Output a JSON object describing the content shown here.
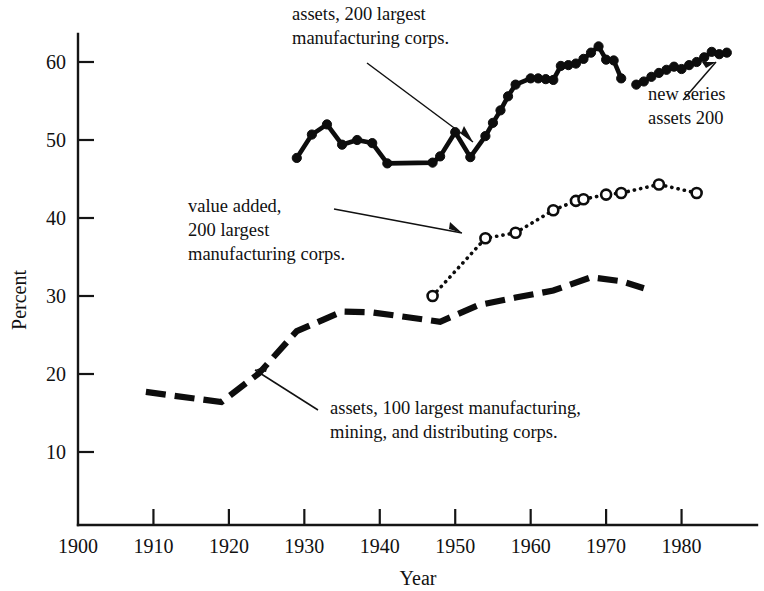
{
  "chart_data": {
    "type": "line",
    "title": "",
    "xlabel": "Year",
    "ylabel": "Percent",
    "xlim": [
      1900,
      1990
    ],
    "ylim": [
      0,
      65
    ],
    "xticks": [
      1900,
      1910,
      1920,
      1930,
      1940,
      1950,
      1960,
      1970,
      1980
    ],
    "yticks": [
      10,
      20,
      30,
      40,
      50,
      60
    ],
    "grid": false,
    "legend": "annotations on plot",
    "series": [
      {
        "name": "assets, 200 largest manufacturing corps.",
        "style": "solid line with filled circle markers",
        "x": [
          1929,
          1931,
          1933,
          1935,
          1937,
          1939,
          1941,
          1947,
          1948,
          1950,
          1952,
          1954,
          1955,
          1956,
          1957,
          1958,
          1960,
          1961,
          1962,
          1963,
          1964,
          1965,
          1966,
          1967,
          1968,
          1969,
          1970,
          1971,
          1972
        ],
        "values": [
          47.7,
          50.7,
          52.0,
          49.4,
          50.0,
          49.6,
          47.0,
          47.1,
          47.9,
          51.0,
          47.8,
          50.5,
          52.2,
          53.8,
          55.6,
          57.1,
          57.9,
          57.9,
          57.8,
          57.7,
          59.5,
          59.6,
          59.8,
          60.4,
          61.2,
          62.0,
          60.3,
          60.2,
          57.9
        ]
      },
      {
        "name": "new series assets 200",
        "style": "solid line with filled circle markers",
        "x": [
          1974,
          1975,
          1976,
          1977,
          1978,
          1979,
          1980,
          1981,
          1982,
          1983,
          1984,
          1985,
          1986
        ],
        "values": [
          57.1,
          57.5,
          58.1,
          58.6,
          59.0,
          59.4,
          59.1,
          59.6,
          60.0,
          60.6,
          61.3,
          61.0,
          61.2
        ]
      },
      {
        "name": "value added, 200 largest manufacturing corps.",
        "style": "dotted line with open circle markers",
        "x": [
          1947,
          1954,
          1958,
          1963,
          1966,
          1967,
          1970,
          1972,
          1977,
          1982
        ],
        "values": [
          30.0,
          37.4,
          38.1,
          41.0,
          42.2,
          42.4,
          43.0,
          43.2,
          44.3,
          43.2
        ]
      },
      {
        "name": "assets, 100 largest manufacturing, mining, and distributing corps.",
        "style": "dashed line, no markers",
        "x": [
          1909,
          1919,
          1924,
          1929,
          1935,
          1939,
          1948,
          1953,
          1958,
          1963,
          1968,
          1972,
          1975
        ],
        "values": [
          17.7,
          16.4,
          20.1,
          25.5,
          28.0,
          27.9,
          26.7,
          28.8,
          29.8,
          30.7,
          32.4,
          31.9,
          31.0
        ]
      }
    ],
    "annotations": [
      {
        "id": "annot-assets200",
        "lines": [
          "assets, 200 largest",
          "manufacturing corps."
        ]
      },
      {
        "id": "annot-new-series",
        "lines": [
          "new series",
          "assets 200"
        ]
      },
      {
        "id": "annot-value-added",
        "lines": [
          "value added,",
          "200 largest",
          "manufacturing corps."
        ]
      },
      {
        "id": "annot-assets100",
        "lines": [
          "assets, 100 largest manufacturing,",
          "mining, and distributing corps."
        ]
      }
    ],
    "colors": {
      "ink": "#0d0d0d",
      "background": "#ffffff"
    }
  },
  "axis": {
    "x_title": "Year",
    "y_title": "Percent",
    "x_tick_labels": [
      "1900",
      "1910",
      "1920",
      "1930",
      "1940",
      "1950",
      "1960",
      "1970",
      "1980"
    ],
    "y_tick_labels": [
      "10",
      "20",
      "30",
      "40",
      "50",
      "60"
    ]
  },
  "annotations": {
    "assets200": {
      "line1": "assets, 200 largest",
      "line2": "manufacturing corps."
    },
    "new_series": {
      "line1": "new series",
      "line2": "assets 200"
    },
    "value_added": {
      "line1": "value added,",
      "line2": "200 largest",
      "line3": "manufacturing corps."
    },
    "assets100": {
      "line1": "assets, 100 largest manufacturing,",
      "line2": "mining, and distributing corps."
    }
  }
}
